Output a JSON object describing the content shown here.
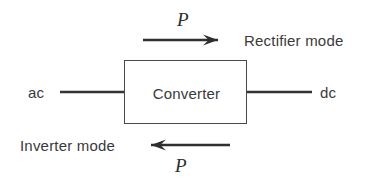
{
  "figure": {
    "background_color": "#ffffff",
    "line_color": "#333333",
    "text_color": "#3a3a3a",
    "width": 367,
    "height": 183
  },
  "block": {
    "label": "Converter",
    "border_color": "#4a4a4a"
  },
  "terminals": {
    "left_label": "ac",
    "right_label": "dc"
  },
  "flows": [
    {
      "id": "rectifier",
      "mode_label": "Rectifier mode",
      "power_symbol": "P",
      "direction": "right",
      "description": "Power flows from ac side to dc side"
    },
    {
      "id": "inverter",
      "mode_label": "Inverter mode",
      "power_symbol": "P",
      "direction": "left",
      "description": "Power flows from dc side to ac side"
    }
  ]
}
